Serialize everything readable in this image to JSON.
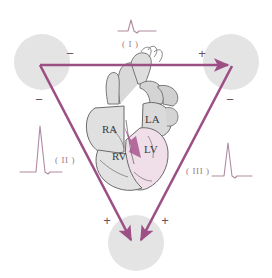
{
  "diagram": {
    "colors": {
      "lead_line": "#9c4f84",
      "lead_line_soft": "#a8608e",
      "electrode_pad": "#e4e4e4",
      "ecg_trace": "#b08aa0",
      "sign_text": "#6f5060",
      "lead_label_text": "#9a7b8c",
      "chamber_text": "#3a3a3a",
      "heart_outline": "#6b6b6b",
      "heart_fill": "#d9d9d9",
      "axis_arrow": "#a8568f",
      "background": "#ffffff"
    }
  },
  "leads": [
    {
      "id": "lead-1",
      "label": "( I )",
      "position": "top",
      "ecg_name": "ecg-trace-lead-i",
      "amplitude": "small"
    },
    {
      "id": "lead-2",
      "label": "( II )",
      "position": "left",
      "ecg_name": "ecg-trace-lead-ii",
      "amplitude": "tall"
    },
    {
      "id": "lead-3",
      "label": "( III )",
      "position": "right",
      "ecg_name": "ecg-trace-lead-iii",
      "amplitude": "medium"
    }
  ],
  "electrodes": [
    {
      "id": "electrode-right-arm",
      "name": "right-arm-electrode",
      "position": "top-left"
    },
    {
      "id": "electrode-left-arm",
      "name": "left-arm-electrode",
      "position": "top-right"
    },
    {
      "id": "electrode-left-leg",
      "name": "left-leg-electrode",
      "position": "bottom"
    }
  ],
  "polarity_markers": [
    {
      "id": "sign-ra-lead1",
      "symbol": "−",
      "lead": "I",
      "electrode": "right-arm"
    },
    {
      "id": "sign-la-lead1",
      "symbol": "+",
      "lead": "I",
      "electrode": "left-arm"
    },
    {
      "id": "sign-ra-lead2",
      "symbol": "−",
      "lead": "II",
      "electrode": "right-arm"
    },
    {
      "id": "sign-ll-lead2",
      "symbol": "+",
      "lead": "II",
      "electrode": "left-leg"
    },
    {
      "id": "sign-la-lead3",
      "symbol": "−",
      "lead": "III",
      "electrode": "left-arm"
    },
    {
      "id": "sign-ll-lead3",
      "symbol": "+",
      "lead": "III",
      "electrode": "left-leg"
    }
  ],
  "heart": {
    "chambers": [
      {
        "id": "chamber-ra",
        "abbr": "RA",
        "name": "right-atrium"
      },
      {
        "id": "chamber-la",
        "abbr": "LA",
        "name": "left-atrium"
      },
      {
        "id": "chamber-rv",
        "abbr": "RV",
        "name": "right-ventricle"
      },
      {
        "id": "chamber-lv",
        "abbr": "LV",
        "name": "left-ventricle"
      }
    ],
    "axis_arrow_label": "mean-electrical-axis"
  }
}
